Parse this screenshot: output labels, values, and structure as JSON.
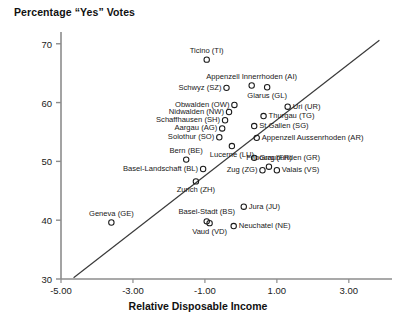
{
  "chart_data": {
    "type": "scatter",
    "title": "Percentage “Yes” Votes",
    "xlabel": "Relative Disposable Income",
    "ylabel": "Percentage “Yes” Votes",
    "xlim": [
      -5.0,
      4.2
    ],
    "ylim": [
      30,
      72
    ],
    "xticks": [
      "-5.00",
      "-3.00",
      "-1.00",
      "1.00",
      "3.00"
    ],
    "xtick_values": [
      -5.0,
      -3.0,
      -1.0,
      1.0,
      3.0
    ],
    "yticks": [
      "30",
      "40",
      "50",
      "60",
      "70"
    ],
    "ytick_values": [
      30,
      40,
      50,
      60,
      70
    ],
    "grid": false,
    "legend": "none",
    "marker": "open-circle",
    "trendline": {
      "label": "regression-line",
      "x1": -4.65,
      "y1": 30.2,
      "x2": 3.85,
      "y2": 70.6
    },
    "points": [
      {
        "label": "Ticino (TI)",
        "code": "TI",
        "x": -0.95,
        "y": 67.3,
        "label_pos": "above"
      },
      {
        "label": "Appenzell Innerrhoden (AI)",
        "code": "AI",
        "x": 0.3,
        "y": 62.9,
        "label_pos": "above"
      },
      {
        "label": "Schwyz (SZ)",
        "code": "SZ",
        "x": -0.4,
        "y": 62.5,
        "label_pos": "left"
      },
      {
        "label": "Glarus (GL)",
        "code": "GL",
        "x": 0.73,
        "y": 62.6,
        "label_pos": "below"
      },
      {
        "label": "Obwalden (OW)",
        "code": "OW",
        "x": -0.18,
        "y": 59.6,
        "label_pos": "left"
      },
      {
        "label": "Nidwalden (NW)",
        "code": "NW",
        "x": -0.33,
        "y": 58.4,
        "label_pos": "left"
      },
      {
        "label": "Uri (UR)",
        "code": "UR",
        "x": 1.3,
        "y": 59.3,
        "label_pos": "right"
      },
      {
        "label": "Schaffhausen (SH)",
        "code": "SH",
        "x": -0.44,
        "y": 57.0,
        "label_pos": "left"
      },
      {
        "label": "Thurgau (TG)",
        "code": "TG",
        "x": 0.63,
        "y": 57.7,
        "label_pos": "right"
      },
      {
        "label": "Aargau (AG)",
        "code": "AG",
        "x": -0.52,
        "y": 55.6,
        "label_pos": "left"
      },
      {
        "label": "St.Gallen (SG)",
        "code": "SG",
        "x": 0.37,
        "y": 56.0,
        "label_pos": "right"
      },
      {
        "label": "Solothur (SO)",
        "code": "SO",
        "x": -0.6,
        "y": 54.1,
        "label_pos": "left"
      },
      {
        "label": "Appenzell Aussenrhoden (AR)",
        "code": "AR",
        "x": 0.44,
        "y": 54.0,
        "label_pos": "right"
      },
      {
        "label": "Lucerne (LU)",
        "code": "LU",
        "x": -0.25,
        "y": 52.6,
        "label_pos": "below"
      },
      {
        "label": "Graubunden (GR)",
        "code": "GR",
        "x": 0.37,
        "y": 50.6,
        "label_pos": "right"
      },
      {
        "label": "Bern (BE)",
        "code": "BE",
        "x": -1.52,
        "y": 50.3,
        "label_pos": "above"
      },
      {
        "label": "Basel-Landschaft (BL)",
        "code": "BL",
        "x": -1.05,
        "y": 48.7,
        "label_pos": "left"
      },
      {
        "label": "Fribourg (FR)",
        "code": "FR",
        "x": 0.78,
        "y": 49.1,
        "label_pos": "above"
      },
      {
        "label": "Valais (VS)",
        "code": "VS",
        "x": 1.0,
        "y": 48.5,
        "label_pos": "right"
      },
      {
        "label": "Zug (ZG)",
        "code": "ZG",
        "x": 0.6,
        "y": 48.5,
        "label_pos": "left"
      },
      {
        "label": "Zurich (ZH)",
        "code": "ZH",
        "x": -1.25,
        "y": 46.6,
        "label_pos": "below"
      },
      {
        "label": "Jura (JU)",
        "code": "JU",
        "x": 0.08,
        "y": 42.3,
        "label_pos": "right"
      },
      {
        "label": "Geneva (GE)",
        "code": "GE",
        "x": -3.6,
        "y": 39.6,
        "label_pos": "above"
      },
      {
        "label": "Basel-Stadt (BS)",
        "code": "BS",
        "x": -0.95,
        "y": 39.8,
        "label_pos": "above"
      },
      {
        "label": "Vaud (VD)",
        "code": "VD",
        "x": -0.87,
        "y": 39.5,
        "label_pos": "below"
      },
      {
        "label": "Neuchatel (NE)",
        "code": "NE",
        "x": -0.2,
        "y": 39.0,
        "label_pos": "right"
      }
    ]
  }
}
